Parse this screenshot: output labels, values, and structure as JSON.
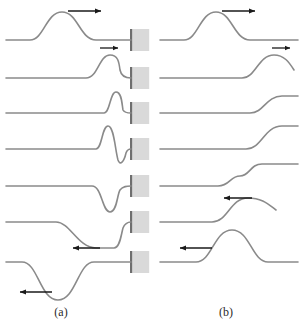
{
  "figure": {
    "width": 304,
    "height": 329,
    "background_color": "#ffffff",
    "rope_color": "#8a8a8a",
    "rope_width": 1.6,
    "arrow_color": "#1a1a1a",
    "wall_fill": "#d9d9d9",
    "wall_edge_color": "#6e6e6e",
    "caption_color": "#2b2b2b"
  },
  "panels": [
    {
      "id": "a",
      "label": "(a)",
      "label_x": 61,
      "label_y": 316,
      "boundary_type": "fixed-end",
      "reflection": "inverted",
      "x_left": 6,
      "x_right": 131,
      "wall": {
        "x": 130,
        "width": 17,
        "height": 22,
        "edge_width": 2.2
      },
      "rows": [
        {
          "index": 1,
          "baseline_y": 40,
          "description": "upright pulse travelling right toward wall, far from boundary",
          "path": "M 6 40 L 30 40 C 44 40 46 12 62 12 C 78 12 80 40 96 40 L 131 40",
          "wall_y": 40,
          "arrow": {
            "x1": 68,
            "y1": 11,
            "x2": 101,
            "y2": 11,
            "direction": "right",
            "size": "large"
          }
        },
        {
          "index": 2,
          "baseline_y": 78,
          "description": "pulse partially absorbed at wall, crest compressed near boundary",
          "path": "M 6 78 L 86 78 C 98 78 99 55 110 55 C 118 55 119 62 120 70 C 121 75 124 78 131 78",
          "wall_y": 78,
          "arrow": {
            "x1": 100,
            "y1": 48,
            "x2": 118,
            "y2": 48,
            "direction": "right",
            "size": "small"
          }
        },
        {
          "index": 3,
          "baseline_y": 113,
          "description": "narrow crest at wall, most of pulse at boundary",
          "path": "M 6 113 L 104 113 C 110 113 110 92 116 92 C 122 92 122 105 123 110 C 124 112 127 113 131 113",
          "wall_y": 113,
          "arrow": null
        },
        {
          "index": 4,
          "baseline_y": 149,
          "description": "crest and emerging trough at wall during reflection",
          "path": "M 6 149 L 96 149 C 102 149 102 126 108 126 C 114 126 115 149 118 160 C 120 166 124 162 126 153 C 127 150 129 149 131 149",
          "wall_y": 149,
          "arrow": null
        },
        {
          "index": 5,
          "baseline_y": 186,
          "description": "inverted trough forming, pulse flipping at fixed end",
          "path": "M 6 186 L 92 186 C 102 186 102 212 110 212 C 117 212 117 195 120 190 C 123 186 127 186 131 186",
          "wall_y": 186,
          "arrow": null
        },
        {
          "index": 6,
          "baseline_y": 222,
          "description": "inverted pulse moving left away from wall",
          "path": "M 6 222 L 56 222 C 70 222 78 248 96 248 L 114 248 C 120 248 121 235 123 228 C 125 223 128 222 131 222",
          "wall_y": 222,
          "arrow": {
            "x1": 73,
            "y1": 248,
            "x2": 100,
            "y2": 248,
            "direction": "left",
            "size": "large"
          }
        },
        {
          "index": 7,
          "baseline_y": 262,
          "description": "fully inverted pulse travelling left, far from wall",
          "path": "M 6 262 L 22 262 C 38 262 40 300 58 300 C 76 300 78 262 94 262 L 131 262",
          "wall_y": 262,
          "arrow": {
            "x1": 20,
            "y1": 292,
            "x2": 52,
            "y2": 292,
            "direction": "left",
            "size": "large"
          }
        }
      ]
    },
    {
      "id": "b",
      "label": "(b)",
      "label_x": 226,
      "label_y": 316,
      "boundary_type": "free-end",
      "reflection": "upright",
      "x_left": 160,
      "x_right": 298,
      "wall": null,
      "rows": [
        {
          "index": 1,
          "baseline_y": 40,
          "description": "upright pulse travelling right toward free end",
          "path": "M 160 40 L 184 40 C 198 40 200 12 216 12 C 232 12 234 40 250 40 L 298 40",
          "arrow": {
            "x1": 222,
            "y1": 11,
            "x2": 255,
            "y2": 11,
            "direction": "right",
            "size": "large"
          }
        },
        {
          "index": 2,
          "baseline_y": 78,
          "description": "pulse reaching free end, crest rising at the end of the rope",
          "path": "M 160 78 L 242 78 C 256 78 258 55 274 55 C 284 55 289 62 294 70",
          "arrow": {
            "x1": 272,
            "y1": 48,
            "x2": 290,
            "y2": 48,
            "direction": "right",
            "size": "small"
          }
        },
        {
          "index": 3,
          "baseline_y": 113,
          "description": "free end rising, rope displaced upward at boundary",
          "path": "M 160 113 L 250 113 C 264 113 266 96 282 96 L 298 96",
          "arrow": null
        },
        {
          "index": 4,
          "baseline_y": 149,
          "description": "free end at maximum displacement, double amplitude",
          "path": "M 160 149 L 246 149 C 262 149 264 126 282 126 L 298 126",
          "arrow": null
        },
        {
          "index": 5,
          "baseline_y": 186,
          "description": "pulse beginning to travel back left, step shape forming",
          "path": "M 160 186 L 218 186 C 230 186 230 176 240 176 C 250 176 250 164 262 164 L 298 164",
          "arrow": null
        },
        {
          "index": 6,
          "baseline_y": 222,
          "description": "upright reflected pulse moving left away from free end",
          "path": "M 160 222 L 212 222 C 228 222 230 198 248 198 C 262 198 268 204 276 210",
          "arrow": {
            "x1": 224,
            "y1": 198,
            "x2": 252,
            "y2": 198,
            "direction": "left",
            "size": "large"
          }
        },
        {
          "index": 7,
          "baseline_y": 262,
          "description": "upright pulse travelling left, far from free end",
          "path": "M 160 262 L 196 262 C 212 262 214 230 232 230 C 250 230 252 262 268 262 L 298 262",
          "arrow": {
            "x1": 180,
            "y1": 248,
            "x2": 212,
            "y2": 248,
            "direction": "left",
            "size": "large"
          }
        }
      ]
    }
  ],
  "chart_data": {
    "type": "line",
    "xlabel": "",
    "ylabel": "",
    "series": [
      {
        "name": "(a) fixed end - row 1",
        "description": "upright incident pulse moving right"
      },
      {
        "name": "(a) fixed end - row 2",
        "description": "pulse compressing at wall"
      },
      {
        "name": "(a) fixed end - row 3",
        "description": "narrow crest at wall"
      },
      {
        "name": "(a) fixed end - row 4",
        "description": "crest plus emerging trough"
      },
      {
        "name": "(a) fixed end - row 5",
        "description": "inverted trough forming"
      },
      {
        "name": "(a) fixed end - row 6",
        "description": "inverted pulse leaving wall"
      },
      {
        "name": "(a) fixed end - row 7",
        "description": "fully inverted pulse moving left"
      },
      {
        "name": "(b) free end - row 1",
        "description": "upright incident pulse moving right"
      },
      {
        "name": "(b) free end - row 2",
        "description": "crest rising at free end"
      },
      {
        "name": "(b) free end - row 3",
        "description": "end displaced upward"
      },
      {
        "name": "(b) free end - row 4",
        "description": "maximum displacement at free end"
      },
      {
        "name": "(b) free end - row 5",
        "description": "step shape, pulse returning"
      },
      {
        "name": "(b) free end - row 6",
        "description": "upright reflected pulse leaving"
      },
      {
        "name": "(b) free end - row 7",
        "description": "upright pulse moving left"
      }
    ]
  }
}
